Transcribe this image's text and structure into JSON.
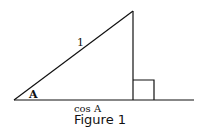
{
  "figure": {
    "caption": "Figure 1",
    "labels": {
      "hypotenuse": "1",
      "angle": "A",
      "base": "cos A"
    },
    "colors": {
      "stroke": "#111111",
      "background": "#ffffff"
    }
  }
}
